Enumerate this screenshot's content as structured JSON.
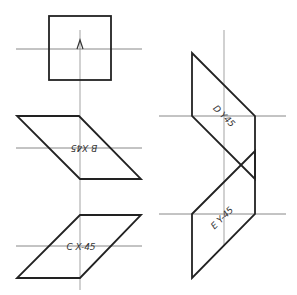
{
  "diagram": {
    "left_column": {
      "square_label": "A",
      "parallelogram_b_label": "B X45",
      "parallelogram_c_label": "C X-45"
    },
    "right_column": {
      "parallelogram_d_label": "D Y45",
      "parallelogram_e_label": "E Y-45"
    },
    "colors": {
      "stroke": "#222222",
      "axis": "#888888",
      "background": "#ffffff"
    }
  }
}
